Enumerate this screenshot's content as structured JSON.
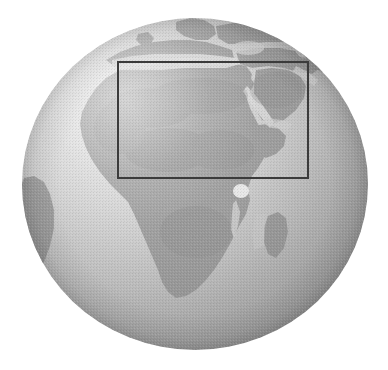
{
  "image": {
    "type": "globe-orthographic-projection",
    "subject": "Earth globe centered on Africa",
    "width": 388,
    "height": 370,
    "background_color": "#ffffff",
    "rendering": "grayscale shaded relief, halftone/dithered texture"
  },
  "globe": {
    "name": "earth-globe",
    "center_x": 195,
    "center_y": 184,
    "radius_x": 173,
    "radius_y": 166,
    "ocean_color_lit": "#d8d8d8",
    "ocean_color_shadow": "#a2a2a2",
    "land_color": "#9a9a9a",
    "land_color_dark": "#888888",
    "highlight_color": "#eeeeee",
    "terminator_color": "#9c9c9c",
    "projection_center_label": "Africa",
    "landmasses": [
      {
        "name": "africa",
        "label": "Africa"
      },
      {
        "name": "europe",
        "label": "Europe"
      },
      {
        "name": "scandinavia",
        "label": "Scandinavia"
      },
      {
        "name": "arabian-peninsula",
        "label": "Arabian Peninsula"
      },
      {
        "name": "madagascar",
        "label": "Madagascar"
      },
      {
        "name": "south-america-limb",
        "label": "South America"
      },
      {
        "name": "middle-east",
        "label": "Middle East"
      }
    ],
    "water_features": [
      {
        "name": "mediterranean-sea",
        "label": "Mediterranean Sea"
      },
      {
        "name": "red-sea",
        "label": "Red Sea"
      },
      {
        "name": "persian-gulf",
        "label": "Persian Gulf"
      },
      {
        "name": "lake-victoria",
        "label": "Lake Victoria"
      },
      {
        "name": "atlantic-ocean",
        "label": "Atlantic Ocean"
      },
      {
        "name": "indian-ocean",
        "label": "Indian Ocean"
      }
    ]
  },
  "roi": {
    "name": "region-of-interest-rectangle",
    "label": "Selected region",
    "stroke_color": "#3b3b3b",
    "stroke_width_px": 2,
    "fill": "none",
    "left": 117,
    "top": 61,
    "width": 192,
    "height": 118,
    "covers": "North Africa, Sahara, Mediterranean coast, Red Sea, Arabian Peninsula"
  }
}
